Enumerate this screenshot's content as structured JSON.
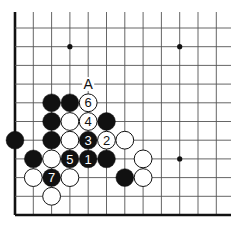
{
  "diagram": {
    "type": "go-board-fragment",
    "grid": {
      "cols": 12,
      "rows": 11,
      "x0": 15,
      "dx": 18.3,
      "y0": 28,
      "dy": 18.7,
      "top_y": 12,
      "right_x": 231,
      "edges": [
        "left",
        "bottom"
      ]
    },
    "star_points": [
      {
        "c": 3,
        "r": 1
      },
      {
        "c": 9,
        "r": 1
      },
      {
        "c": 9,
        "r": 7
      }
    ],
    "stones": [
      {
        "c": 2,
        "r": 4,
        "color": "black",
        "label": ""
      },
      {
        "c": 3,
        "r": 4,
        "color": "black",
        "label": ""
      },
      {
        "c": 4,
        "r": 4,
        "color": "white",
        "label": "6"
      },
      {
        "c": 2,
        "r": 5,
        "color": "black",
        "label": ""
      },
      {
        "c": 3,
        "r": 5,
        "color": "white",
        "label": ""
      },
      {
        "c": 4,
        "r": 5,
        "color": "white",
        "label": "4"
      },
      {
        "c": 5,
        "r": 5,
        "color": "black",
        "label": ""
      },
      {
        "c": 0,
        "r": 6,
        "color": "black",
        "label": ""
      },
      {
        "c": 2,
        "r": 6,
        "color": "black",
        "label": ""
      },
      {
        "c": 3,
        "r": 6,
        "color": "white",
        "label": ""
      },
      {
        "c": 4,
        "r": 6,
        "color": "black",
        "label": "3"
      },
      {
        "c": 5,
        "r": 6,
        "color": "white",
        "label": "2"
      },
      {
        "c": 6,
        "r": 6,
        "color": "white",
        "label": ""
      },
      {
        "c": 1,
        "r": 7,
        "color": "black",
        "label": ""
      },
      {
        "c": 2,
        "r": 7,
        "color": "white",
        "label": ""
      },
      {
        "c": 3,
        "r": 7,
        "color": "black",
        "label": "5"
      },
      {
        "c": 4,
        "r": 7,
        "color": "black",
        "label": "1"
      },
      {
        "c": 5,
        "r": 7,
        "color": "black",
        "label": ""
      },
      {
        "c": 7,
        "r": 7,
        "color": "white",
        "label": ""
      },
      {
        "c": 1,
        "r": 8,
        "color": "white",
        "label": ""
      },
      {
        "c": 2,
        "r": 8,
        "color": "black",
        "label": "7"
      },
      {
        "c": 3,
        "r": 8,
        "color": "white",
        "label": ""
      },
      {
        "c": 6,
        "r": 8,
        "color": "black",
        "label": ""
      },
      {
        "c": 7,
        "r": 8,
        "color": "white",
        "label": ""
      },
      {
        "c": 2,
        "r": 9,
        "color": "white",
        "label": ""
      }
    ],
    "markers": [
      {
        "c": 4,
        "r": 3,
        "text": "A"
      }
    ],
    "colors": {
      "line": "#555555",
      "edge": "#111111",
      "black_stone": "#111111",
      "white_stone": "#ffffff"
    }
  }
}
